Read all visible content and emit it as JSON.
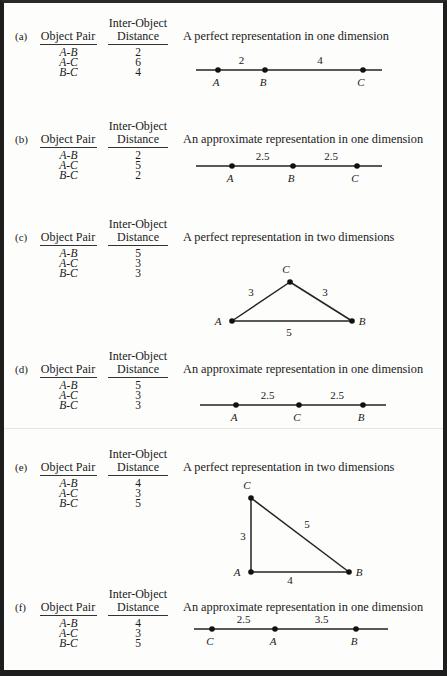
{
  "table_headers": {
    "pair": "Object Pair",
    "distance_line1": "Inter-Object",
    "distance_line2": "Distance"
  },
  "panels": [
    {
      "id": "a",
      "label": "(a)",
      "caption": "A perfect representation in one dimension",
      "rows": [
        {
          "pair": "A-B",
          "distance": "2"
        },
        {
          "pair": "A-C",
          "distance": "6"
        },
        {
          "pair": "B-C",
          "distance": "4"
        }
      ],
      "figure": {
        "type": "1d",
        "points": [
          {
            "name": "A",
            "pos": 0
          },
          {
            "name": "B",
            "pos": 2
          },
          {
            "name": "C",
            "pos": 6
          }
        ],
        "segment_labels": [
          "2",
          "4"
        ]
      }
    },
    {
      "id": "b",
      "label": "(b)",
      "caption": "An approximate representation in one dimension",
      "rows": [
        {
          "pair": "A-B",
          "distance": "2"
        },
        {
          "pair": "A-C",
          "distance": "5"
        },
        {
          "pair": "B-C",
          "distance": "2"
        }
      ],
      "figure": {
        "type": "1d",
        "points": [
          {
            "name": "A",
            "pos": 0
          },
          {
            "name": "B",
            "pos": 2.5
          },
          {
            "name": "C",
            "pos": 5
          }
        ],
        "segment_labels": [
          "2.5",
          "2.5"
        ]
      }
    },
    {
      "id": "c",
      "label": "(c)",
      "caption": "A perfect representation in two dimensions",
      "rows": [
        {
          "pair": "A-B",
          "distance": "5"
        },
        {
          "pair": "A-C",
          "distance": "3"
        },
        {
          "pair": "B-C",
          "distance": "3"
        }
      ],
      "figure": {
        "type": "2d",
        "points": [
          {
            "name": "A"
          },
          {
            "name": "B"
          },
          {
            "name": "C"
          }
        ],
        "edge_labels": {
          "AC": "3",
          "CB": "3",
          "AB": "5"
        }
      }
    },
    {
      "id": "d",
      "label": "(d)",
      "caption": "An approximate representation in one dimension",
      "rows": [
        {
          "pair": "A-B",
          "distance": "5"
        },
        {
          "pair": "A-C",
          "distance": "3"
        },
        {
          "pair": "B-C",
          "distance": "3"
        }
      ],
      "figure": {
        "type": "1d",
        "points": [
          {
            "name": "A",
            "pos": 0
          },
          {
            "name": "C",
            "pos": 2.5
          },
          {
            "name": "B",
            "pos": 5
          }
        ],
        "segment_labels": [
          "2.5",
          "2.5"
        ]
      }
    },
    {
      "id": "e",
      "label": "(e)",
      "caption": "A perfect representation in two dimensions",
      "rows": [
        {
          "pair": "A-B",
          "distance": "4"
        },
        {
          "pair": "A-C",
          "distance": "3"
        },
        {
          "pair": "B-C",
          "distance": "5"
        }
      ],
      "figure": {
        "type": "2d",
        "points": [
          {
            "name": "A"
          },
          {
            "name": "B"
          },
          {
            "name": "C"
          }
        ],
        "edge_labels": {
          "AC": "3",
          "CB": "5",
          "AB": "4"
        }
      }
    },
    {
      "id": "f",
      "label": "(f)",
      "caption": "An approximate representation in one dimension",
      "rows": [
        {
          "pair": "A-B",
          "distance": "4"
        },
        {
          "pair": "A-C",
          "distance": "3"
        },
        {
          "pair": "B-C",
          "distance": "5"
        }
      ],
      "figure": {
        "type": "1d",
        "points": [
          {
            "name": "C",
            "pos": 0
          },
          {
            "name": "A",
            "pos": 2.5
          },
          {
            "name": "B",
            "pos": 6
          }
        ],
        "segment_labels": [
          "2.5",
          "3.5"
        ]
      }
    }
  ]
}
